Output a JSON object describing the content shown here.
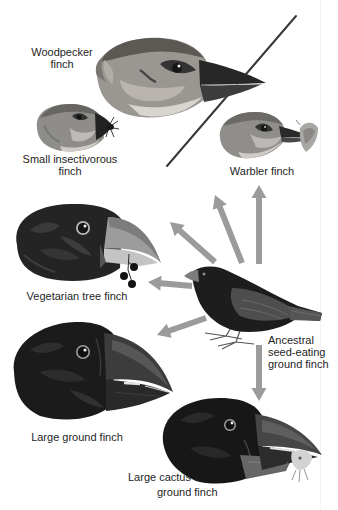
{
  "labels": {
    "woodpecker": [
      "Woodpecker",
      "finch"
    ],
    "small_insectivorous": [
      "Small insectivorous",
      "finch"
    ],
    "warbler": [
      "Warbler finch"
    ],
    "vegetarian": [
      "Vegetarian tree finch"
    ],
    "ancestral": [
      "Ancestral",
      "seed-eating",
      "ground finch"
    ],
    "large_ground": [
      "Large ground finch"
    ],
    "large_cactus": [
      "Large cactus",
      "ground finch"
    ]
  },
  "illustrations": [
    {
      "species": "woodpecker",
      "view": "head",
      "beak_item": "twig"
    },
    {
      "species": "small_insectivorous",
      "view": "head",
      "beak_item": "insect"
    },
    {
      "species": "warbler",
      "view": "head",
      "beak_item": "moth"
    },
    {
      "species": "vegetarian",
      "view": "head",
      "beak_item": "berries"
    },
    {
      "species": "ancestral",
      "view": "full body"
    },
    {
      "species": "large_ground",
      "view": "head"
    },
    {
      "species": "large_cactus",
      "view": "head",
      "beak_item": "insect"
    }
  ],
  "arrows": [
    {
      "from": "ancestral",
      "to": "warbler"
    },
    {
      "from": "ancestral",
      "to": "woodpecker"
    },
    {
      "from": "ancestral",
      "to": "small_insectivorous"
    },
    {
      "from": "ancestral",
      "to": "vegetarian"
    },
    {
      "from": "ancestral",
      "to": "large_ground"
    },
    {
      "from": "ancestral",
      "to": "large_cactus"
    }
  ],
  "colors": {
    "background": "#ffffff",
    "arrow": "#9b9b9b",
    "text": "#1e1e1e"
  }
}
